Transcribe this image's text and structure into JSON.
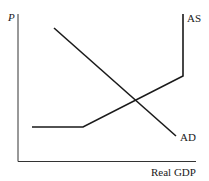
{
  "chart_data": {
    "type": "line",
    "title": "",
    "xlabel": "Real GDP",
    "ylabel": "P",
    "grid": false,
    "legend": "none",
    "series": [
      {
        "name": "AS",
        "label": "AS",
        "points": [
          [
            32,
            127
          ],
          [
            83,
            127
          ],
          [
            183,
            76
          ],
          [
            183,
            14
          ]
        ],
        "description": "Horizontal segment, then upward-sloping segment, then vertical segment"
      },
      {
        "name": "AD",
        "label": "AD",
        "points": [
          [
            54,
            28
          ],
          [
            176,
            136
          ]
        ],
        "description": "Downward-sloping straight line"
      }
    ],
    "axes": {
      "origin": [
        18,
        161
      ],
      "y_top": 14,
      "x_right": 196
    }
  },
  "labels": {
    "y_axis": "P",
    "x_axis": "Real GDP",
    "as_curve": "AS",
    "ad_curve": "AD"
  },
  "colors": {
    "line": "#1a1a1a",
    "axis": "#333333",
    "background": "#ffffff"
  }
}
